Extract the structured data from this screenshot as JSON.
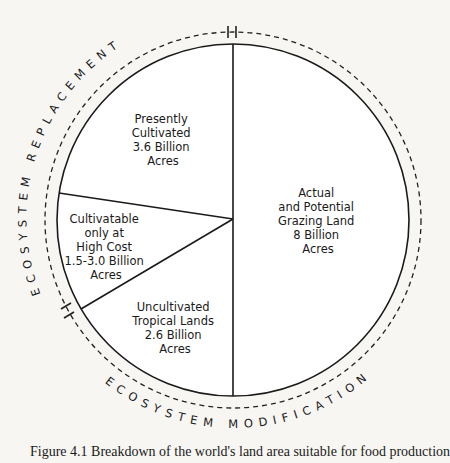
{
  "diagram": {
    "type": "pie-diagram",
    "segments": [
      {
        "id": "presently-cultivated",
        "lines": [
          "Presently",
          "Cultivated",
          "3.6 Billion",
          "Acres"
        ],
        "value_billion_acres": 3.6
      },
      {
        "id": "cultivatable-high-cost",
        "lines": [
          "Cultivatable",
          "only at",
          "High Cost",
          "1.5-3.0 Billion",
          "Acres"
        ],
        "value_billion_acres": "1.5-3.0"
      },
      {
        "id": "uncultivated-tropical",
        "lines": [
          "Uncultivated",
          "Tropical Lands",
          "2.6 Billion",
          "Acres"
        ],
        "value_billion_acres": 2.6
      },
      {
        "id": "grazing-land",
        "lines": [
          "Actual",
          "and Potential",
          "Grazing Land",
          "8 Billion",
          "Acres"
        ],
        "value_billion_acres": 8
      }
    ],
    "outer_arcs": [
      {
        "id": "ecosystem-replacement",
        "label": "ECOSYSTEM REPLACEMENT"
      },
      {
        "id": "ecosystem-modification",
        "label": "ECOSYSTEM MODIFICATION"
      }
    ]
  },
  "caption": "Figure 4.1   Breakdown of the world's land area suitable for food production"
}
